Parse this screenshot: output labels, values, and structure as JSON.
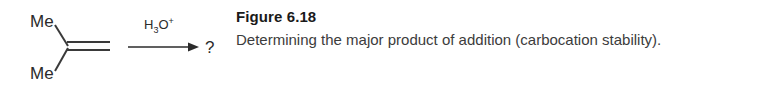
{
  "figure": {
    "title": "Figure 6.18",
    "caption": "Determining the major product of addition (carbocation stability)."
  },
  "scheme": {
    "reactant": {
      "name": "2-methylpropene",
      "substituent_top": "Me",
      "substituent_bottom": "Me",
      "bond_type": "double"
    },
    "reagent": {
      "formula": "H",
      "subscript": "3",
      "element": "O",
      "charge": "+"
    },
    "arrow": {
      "direction": "right"
    },
    "product": {
      "label": "?"
    }
  },
  "colors": {
    "background": "#ffffff",
    "bond": "#3a3a3a",
    "text": "#2b2b2b",
    "caption_title": "#1a1a1a",
    "caption_body": "#3c3c3c"
  }
}
